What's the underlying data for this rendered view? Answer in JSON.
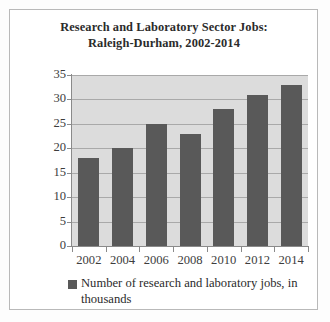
{
  "chart_data": {
    "type": "bar",
    "title": "Research and Laboratory Sector Jobs: Raleigh-Durham, 2002-2014",
    "title_lines": [
      "Research and Laboratory Sector Jobs:",
      "Raleigh-Durham, 2002-2014"
    ],
    "categories": [
      "2002",
      "2004",
      "2006",
      "2008",
      "2010",
      "2012",
      "2014"
    ],
    "values": [
      18,
      20,
      25,
      23,
      28,
      31,
      33
    ],
    "series": [
      {
        "name": "Number of research and laboratory jobs, in thousands",
        "values": [
          18,
          20,
          25,
          23,
          28,
          31,
          33
        ]
      }
    ],
    "xlabel": "",
    "ylabel": "",
    "ylim": [
      0,
      35
    ],
    "yticks": [
      0,
      5,
      10,
      15,
      20,
      25,
      30,
      35
    ],
    "ytick_labels": [
      "0",
      "5",
      "10",
      "15",
      "20",
      "25",
      "30",
      "35"
    ],
    "grid": true,
    "grid_axis": "y",
    "legend_position": "bottom",
    "legend_entries": [
      "Number of research and laboratory jobs, in thousands"
    ],
    "legend_lines": [
      "Number of research and laboratory",
      "jobs, in thousands"
    ],
    "colors": {
      "bar": "#595959",
      "plot_background": "#dcdcdc",
      "gridline": "#a9a9a9",
      "axis": "#8a8a8a",
      "text": "#2b2b2b",
      "frame_border": "#b9b9b9",
      "figure_background": "#ffffff"
    }
  }
}
